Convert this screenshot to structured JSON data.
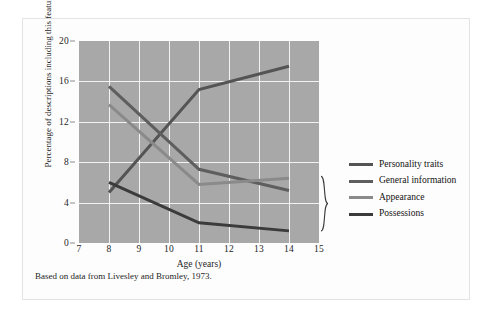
{
  "figure": {
    "caption": "Based on data from Livesley and Bromley, 1973.",
    "plot_background": "#a8a8a8",
    "grid_color": "#f2f2f2"
  },
  "legend": {
    "entries": [
      {
        "label": "Personality traits",
        "color": "#545454"
      },
      {
        "label": "General information",
        "color": "#5e5e5e"
      },
      {
        "label": "Appearance",
        "color": "#8a8a8a"
      },
      {
        "label": "Possessions",
        "color": "#3b3b3b"
      }
    ]
  },
  "chart_data": {
    "type": "line",
    "title": "",
    "xlabel": "Age (years)",
    "ylabel": "Percentage of descriptions including this feature",
    "xlim": [
      7,
      15
    ],
    "ylim": [
      0,
      20
    ],
    "xticks": [
      7,
      8,
      9,
      10,
      11,
      12,
      13,
      14,
      15
    ],
    "yticks": [
      0,
      4,
      8,
      12,
      16,
      20
    ],
    "grid": true,
    "legend_position": "right",
    "x": [
      8,
      11,
      14
    ],
    "series": [
      {
        "name": "Personality traits",
        "values": [
          5.0,
          15.2,
          17.5
        ],
        "color": "#545454"
      },
      {
        "name": "General information",
        "values": [
          15.5,
          7.3,
          5.2
        ],
        "color": "#5e5e5e"
      },
      {
        "name": "Appearance",
        "values": [
          13.7,
          5.8,
          6.4
        ],
        "color": "#8a8a8a"
      },
      {
        "name": "Possessions",
        "values": [
          6.0,
          2.0,
          1.2
        ],
        "color": "#3b3b3b"
      }
    ],
    "annotations": [
      {
        "type": "brace",
        "label": "",
        "x": 14.3,
        "y_from": 1.2,
        "y_to": 6.6
      }
    ]
  }
}
